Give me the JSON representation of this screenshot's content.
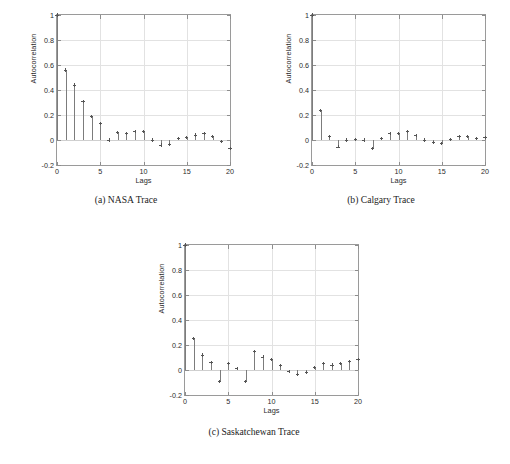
{
  "figure": {
    "background_color": "#ffffff",
    "line_color": "#7c7c7c",
    "grid_color": "#e2e2e2",
    "axis_color": "#9a9a9a"
  },
  "chart_data": [
    {
      "type": "scatter",
      "panel": "a",
      "title": "(a) NASA Trace",
      "caption": "(a) NASA Trace",
      "xlabel": "Lags",
      "ylabel": "Autocorrelation",
      "xlim": [
        0,
        20
      ],
      "ylim": [
        -0.2,
        1
      ],
      "xticks": [
        0,
        5,
        10,
        15,
        20
      ],
      "xticklabels": [
        "0",
        "5",
        "10",
        "15",
        "20"
      ],
      "yticks": [
        -0.2,
        0,
        0.2,
        0.4,
        0.6,
        0.8,
        1
      ],
      "yticklabels": [
        "-0.2",
        "0",
        "0.2",
        "0.4",
        "0.6",
        "0.8",
        "1"
      ],
      "grid": true,
      "legend": "none",
      "x": [
        0,
        1,
        2,
        3,
        4,
        5,
        6,
        7,
        8,
        9,
        10,
        11,
        12,
        13,
        14,
        15,
        16,
        17,
        18,
        19,
        20
      ],
      "values": [
        1,
        0.56,
        0.44,
        0.31,
        0.19,
        0.13,
        0.0,
        0.06,
        0.05,
        0.07,
        0.07,
        0.0,
        -0.04,
        -0.035,
        0.01,
        0.02,
        0.04,
        0.05,
        0.03,
        -0.01,
        -0.07
      ]
    },
    {
      "type": "scatter",
      "panel": "b",
      "title": "(b) Calgary Trace",
      "caption": "(b) Calgary Trace",
      "xlabel": "Lags",
      "ylabel": "Autocorrelation",
      "xlim": [
        0,
        20
      ],
      "ylim": [
        -0.2,
        1
      ],
      "xticks": [
        0,
        5,
        10,
        15,
        20
      ],
      "xticklabels": [
        "0",
        "5",
        "10",
        "15",
        "20"
      ],
      "yticks": [
        -0.2,
        0,
        0.2,
        0.4,
        0.6,
        0.8,
        1
      ],
      "yticklabels": [
        "-0.2",
        "0",
        "0.2",
        "0.4",
        "0.6",
        "0.8",
        "1"
      ],
      "grid": true,
      "legend": "none",
      "x": [
        0,
        1,
        2,
        3,
        4,
        5,
        6,
        7,
        8,
        9,
        10,
        11,
        12,
        13,
        14,
        15,
        16,
        17,
        18,
        19,
        20
      ],
      "values": [
        1,
        0.235,
        0.03,
        -0.055,
        0.0,
        0.005,
        0.0,
        -0.065,
        0.015,
        0.05,
        0.055,
        0.07,
        0.035,
        0.0,
        -0.02,
        -0.03,
        0.005,
        0.03,
        0.03,
        0.015,
        0.02
      ]
    },
    {
      "type": "scatter",
      "panel": "c",
      "title": "(c) Saskatchewan Trace",
      "caption": "(c) Saskatchewan Trace",
      "xlabel": "Lags",
      "ylabel": "Autocorrelation",
      "xlim": [
        0,
        20
      ],
      "ylim": [
        -0.2,
        1
      ],
      "xticks": [
        0,
        5,
        10,
        15,
        20
      ],
      "xticklabels": [
        "0",
        "5",
        "10",
        "15",
        "20"
      ],
      "yticks": [
        -0.2,
        0,
        0.2,
        0.4,
        0.6,
        0.8,
        1
      ],
      "yticklabels": [
        "-0.2",
        "0",
        "0.2",
        "0.4",
        "0.6",
        "0.8",
        "1"
      ],
      "grid": true,
      "legend": "none",
      "x": [
        0,
        1,
        2,
        3,
        4,
        5,
        6,
        7,
        8,
        9,
        10,
        11,
        12,
        13,
        14,
        15,
        16,
        17,
        18,
        19,
        20
      ],
      "values": [
        1,
        0.255,
        0.12,
        0.06,
        -0.09,
        0.055,
        0.01,
        -0.09,
        0.15,
        0.105,
        0.085,
        0.035,
        -0.01,
        -0.035,
        -0.02,
        0.02,
        0.055,
        0.04,
        0.055,
        0.07,
        0.085
      ]
    }
  ]
}
